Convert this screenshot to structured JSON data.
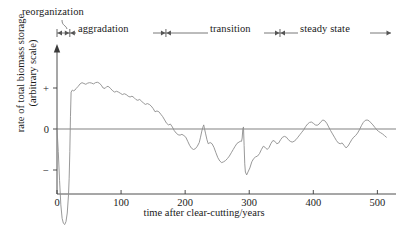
{
  "figure": {
    "type": "line-chart",
    "background": "#ffffff",
    "curve_color": "#8d8d8d",
    "axis_color": "#3a3a3a"
  },
  "axes": {
    "x": {
      "title": "time after clear-cutting/years",
      "ticks": [
        "0",
        "100",
        "200",
        "300",
        "400",
        "500"
      ],
      "tick_values": [
        0,
        100,
        200,
        300,
        400,
        500
      ],
      "min": 0,
      "max": 515
    },
    "y": {
      "title_line1": "rate of total biomass storage",
      "title_line2": "(arbitrary scale)",
      "ticks": [
        "+",
        "0",
        "−"
      ],
      "tick_values": [
        1,
        0,
        -1
      ],
      "min": -2.45,
      "max": 1.55
    }
  },
  "phases": [
    {
      "name": "reorganization",
      "label": "reorganization",
      "start": 0,
      "end": 20
    },
    {
      "name": "aggradation",
      "label": "aggradation",
      "start": 20,
      "end": 170
    },
    {
      "name": "transition",
      "label": "transition",
      "start": 170,
      "end": 348
    },
    {
      "name": "steady-state",
      "label": "steady state",
      "start": 348,
      "end": 515
    }
  ],
  "chart_data": {
    "type": "line",
    "title": "",
    "subtitle": "",
    "xlabel": "time after clear-cutting/years",
    "ylabel": "rate of total biomass storage (arbitrary scale)",
    "xlim": [
      0,
      515
    ],
    "ylim": [
      -2.45,
      1.55
    ],
    "xticks": [
      0,
      100,
      200,
      300,
      400,
      500
    ],
    "yticks": [
      1,
      0,
      -1
    ],
    "ytick_labels": [
      "+",
      "0",
      "−"
    ],
    "grid": false,
    "legend": "none",
    "annotations": [
      {
        "text": "reorganization",
        "x_range": [
          0,
          20
        ],
        "position": "above-axis"
      },
      {
        "text": "aggradation",
        "x_range": [
          20,
          170
        ],
        "position": "above-axis"
      },
      {
        "text": "transition",
        "x_range": [
          170,
          348
        ],
        "position": "above-axis"
      },
      {
        "text": "steady state",
        "x_range": [
          348,
          515
        ],
        "position": "above-axis"
      }
    ],
    "series": [
      {
        "name": "rate of total biomass storage",
        "color": "#8d8d8d",
        "x": [
          0,
          2,
          4,
          6,
          8,
          10,
          12,
          14,
          16,
          18,
          19,
          20,
          21,
          22,
          24,
          26,
          28,
          30,
          33,
          36,
          39,
          42,
          45,
          48,
          51,
          54,
          57,
          60,
          63,
          66,
          69,
          72,
          75,
          78,
          81,
          84,
          87,
          90,
          93,
          96,
          99,
          102,
          105,
          108,
          111,
          114,
          117,
          120,
          123,
          126,
          129,
          132,
          135,
          138,
          141,
          144,
          147,
          150,
          153,
          156,
          159,
          162,
          165,
          168,
          171,
          174,
          177,
          180,
          183,
          186,
          189,
          192,
          195,
          198,
          201,
          204,
          207,
          210,
          213,
          216,
          219,
          222,
          224,
          226,
          228,
          229,
          230,
          232,
          234,
          236,
          239,
          242,
          245,
          248,
          251,
          254,
          257,
          260,
          263,
          266,
          269,
          272,
          275,
          278,
          281,
          284,
          286,
          288,
          289,
          290,
          291,
          292,
          293,
          294,
          296,
          298,
          301,
          304,
          307,
          310,
          313,
          316,
          319,
          322,
          325,
          328,
          331,
          334,
          337,
          340,
          343,
          346,
          349,
          352,
          355,
          358,
          361,
          364,
          367,
          370,
          373,
          376,
          379,
          382,
          385,
          388,
          391,
          394,
          397,
          400,
          403,
          406,
          409,
          412,
          415,
          418,
          421,
          424,
          427,
          430,
          433,
          436,
          439,
          442,
          445,
          448,
          451,
          454,
          457,
          460,
          463,
          466,
          469,
          472,
          475,
          478,
          481,
          484,
          487,
          490,
          493,
          496,
          499,
          502,
          505,
          508,
          511,
          514
        ],
        "y": [
          0.0,
          -0.55,
          -1.25,
          -1.85,
          -2.18,
          -2.3,
          -2.33,
          -2.26,
          -2.05,
          -1.6,
          -1.2,
          -0.55,
          0.3,
          0.9,
          0.95,
          0.93,
          0.95,
          0.99,
          1.04,
          1.1,
          1.13,
          1.11,
          1.09,
          1.12,
          1.13,
          1.12,
          1.1,
          1.13,
          1.14,
          1.12,
          1.07,
          1.0,
          0.99,
          1.04,
          1.03,
          0.98,
          0.93,
          0.9,
          0.92,
          0.9,
          0.87,
          0.84,
          0.86,
          0.84,
          0.8,
          0.78,
          0.8,
          0.77,
          0.72,
          0.7,
          0.72,
          0.68,
          0.63,
          0.6,
          0.62,
          0.6,
          0.56,
          0.5,
          0.42,
          0.44,
          0.42,
          0.36,
          0.3,
          0.22,
          0.14,
          0.1,
          0.12,
          0.05,
          -0.04,
          -0.1,
          -0.14,
          -0.15,
          -0.13,
          -0.16,
          -0.2,
          -0.3,
          -0.4,
          -0.47,
          -0.5,
          -0.48,
          -0.42,
          -0.33,
          -0.2,
          -0.05,
          0.06,
          0.1,
          0.02,
          -0.12,
          -0.26,
          -0.36,
          -0.33,
          -0.36,
          -0.45,
          -0.58,
          -0.7,
          -0.78,
          -0.82,
          -0.8,
          -0.77,
          -0.72,
          -0.66,
          -0.58,
          -0.5,
          -0.42,
          -0.35,
          -0.32,
          -0.3,
          -0.3,
          -0.22,
          0.0,
          0.05,
          -0.4,
          -0.85,
          -1.05,
          -1.12,
          -1.05,
          -0.95,
          -0.8,
          -0.72,
          -0.68,
          -0.66,
          -0.6,
          -0.5,
          -0.42,
          -0.45,
          -0.5,
          -0.45,
          -0.35,
          -0.28,
          -0.3,
          -0.36,
          -0.34,
          -0.26,
          -0.2,
          -0.18,
          -0.2,
          -0.26,
          -0.3,
          -0.32,
          -0.3,
          -0.26,
          -0.2,
          -0.14,
          -0.08,
          -0.02,
          0.06,
          0.12,
          0.16,
          0.17,
          0.14,
          0.1,
          0.09,
          0.12,
          0.18,
          0.22,
          0.2,
          0.14,
          0.05,
          -0.04,
          -0.12,
          -0.2,
          -0.28,
          -0.34,
          -0.36,
          -0.34,
          -0.4,
          -0.46,
          -0.42,
          -0.34,
          -0.26,
          -0.2,
          -0.16,
          -0.1,
          -0.02,
          0.08,
          0.16,
          0.21,
          0.22,
          0.2,
          0.15,
          0.1,
          0.04,
          -0.02,
          -0.06,
          -0.09,
          -0.12,
          -0.16,
          -0.2
        ]
      }
    ]
  }
}
